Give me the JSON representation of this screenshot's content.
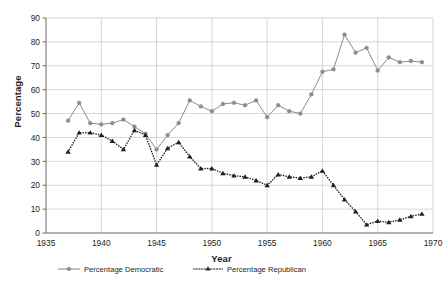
{
  "chart_data": {
    "type": "line",
    "title": "",
    "xlabel": "Year",
    "ylabel": "Percentage",
    "xlim": [
      1935,
      1970
    ],
    "ylim": [
      0,
      90
    ],
    "xticks": [
      1935,
      1940,
      1945,
      1950,
      1955,
      1960,
      1965,
      1970
    ],
    "yticks": [
      0,
      10,
      20,
      30,
      40,
      50,
      60,
      70,
      80,
      90
    ],
    "grid": true,
    "legend_position": "bottom",
    "x": [
      1937,
      1938,
      1939,
      1940,
      1941,
      1942,
      1943,
      1944,
      1945,
      1946,
      1947,
      1948,
      1949,
      1950,
      1951,
      1952,
      1953,
      1954,
      1955,
      1956,
      1957,
      1958,
      1959,
      1960,
      1961,
      1962,
      1963,
      1964,
      1965,
      1966,
      1967,
      1968,
      1969
    ],
    "series": [
      {
        "name": "Percentage Democratic",
        "color": "#8c8c8c",
        "marker": "circle",
        "linestyle": "solid",
        "values": [
          47,
          54.5,
          46,
          45.5,
          46,
          47.5,
          44.5,
          41.5,
          35,
          41,
          46,
          55.5,
          53,
          51,
          54,
          54.5,
          53.5,
          55.5,
          48.5,
          53.5,
          51,
          50,
          58,
          67.5,
          68.5,
          83,
          75.5,
          77.5,
          68,
          73.5,
          71.5,
          72,
          71.5
        ]
      },
      {
        "name": "Percentage Republican",
        "color": "#231f20",
        "marker": "triangle",
        "linestyle": "dotted",
        "values": [
          34,
          42,
          42,
          41,
          38.5,
          35,
          43,
          41,
          28.5,
          35.5,
          38,
          32,
          27,
          27,
          25,
          24,
          23.5,
          22,
          20,
          24.5,
          23.5,
          23,
          23.5,
          26,
          20,
          14,
          9,
          3.5,
          5,
          4.5,
          5.5,
          7,
          8
        ]
      }
    ]
  },
  "legend": {
    "items": [
      {
        "label": "Percentage Democratic"
      },
      {
        "label": "Percentage Republican"
      }
    ]
  }
}
